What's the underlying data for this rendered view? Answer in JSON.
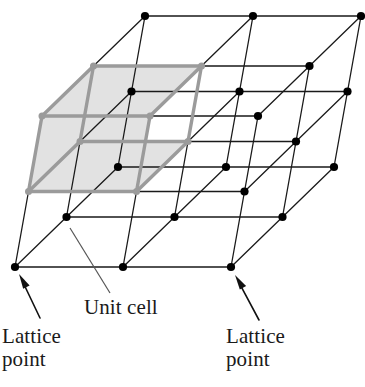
{
  "figure": {
    "kind": "crystal-lattice-diagram",
    "background_color": "#ffffff"
  },
  "labels": {
    "unit_cell": "Unit cell",
    "lattice_point_left": "Lattice\npoint",
    "lattice_point_right": "Lattice\npoint"
  },
  "style": {
    "lattice_line_color": "#1a1a1a",
    "lattice_line_width": 1.3,
    "lattice_point_color": "#000000",
    "lattice_point_radius": 4.1,
    "unit_cell_edge_color": "#9b9b9b",
    "unit_cell_edge_width": 3.4,
    "unit_cell_fill_color": "#e2e2e2",
    "unit_cell_node_color": "#9b9b9b",
    "leader_line_color": "#555555",
    "arrow_color": "#111111",
    "text_color": "#1a1a1a"
  },
  "geometry": {
    "origin": {
      "x": 42.0,
      "y": 116.0
    },
    "vector_a": {
      "x": 108.0,
      "y": 0.0,
      "name": "a",
      "steps": 2
    },
    "vector_b": {
      "x": 51.5,
      "y": -50.0,
      "name": "b",
      "steps": 2
    },
    "vector_c": {
      "x": -13.5,
      "y": 75.5,
      "name": "c",
      "steps": 2
    },
    "counts": {
      "i": 3,
      "j": 3,
      "k": 3
    },
    "unit_cell_index": {
      "i": 0,
      "j": 0,
      "k": 0
    }
  },
  "annotations": {
    "unit_cell_leader": {
      "x1": 110.0,
      "y1": 293.0,
      "x2": 70.0,
      "y2": 228.0
    },
    "arrow_left": {
      "x1": 40.0,
      "y1": 318.0,
      "x2": 19.0,
      "y2": 274.0
    },
    "arrow_right": {
      "x1": 259.0,
      "y1": 320.0,
      "x2": 235.0,
      "y2": 275.0
    }
  }
}
